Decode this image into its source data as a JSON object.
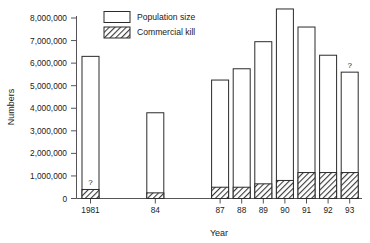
{
  "chart_data": {
    "type": "bar",
    "title": "",
    "xlabel": "Year",
    "ylabel": "Numbers",
    "categories": [
      "1981",
      "84",
      "87",
      "88",
      "89",
      "90",
      "91",
      "92",
      "93"
    ],
    "ylim": [
      0,
      8000000
    ],
    "ytick_values": [
      0,
      1000000,
      2000000,
      3000000,
      4000000,
      5000000,
      6000000,
      7000000,
      8000000
    ],
    "ytick_labels": [
      "0",
      "1,000,000",
      "2,000,000",
      "3,000,000",
      "4,000,000",
      "5,000,000",
      "6,000,000",
      "7,000,000",
      "8,000,000"
    ],
    "grid": false,
    "legend_position": "top-center",
    "stacked": true,
    "series": [
      {
        "name": "Population size",
        "style": "open-white",
        "values": [
          6300000,
          3800000,
          5250000,
          5750000,
          6950000,
          8400000,
          7600000,
          6350000,
          5600000
        ]
      },
      {
        "name": "Commercial kill",
        "style": "hatched",
        "values": [
          400000,
          250000,
          500000,
          500000,
          650000,
          800000,
          1150000,
          1150000,
          1150000
        ]
      }
    ],
    "annotations": [
      {
        "label": "?",
        "category": "1981",
        "placement": "inside-bar"
      },
      {
        "label": "?",
        "category": "93",
        "placement": "above-bar"
      }
    ]
  },
  "legend": {
    "items": [
      {
        "label": "Population size",
        "swatch": "open-white"
      },
      {
        "label": "Commercial kill",
        "swatch": "hatched"
      }
    ]
  },
  "colors": {
    "axis": "#555555",
    "bar_outline": "#2b2b2b",
    "bar_fill_population": "#ffffff",
    "bar_fill_kill": "#8a8a8a",
    "text": "#1a1a1a",
    "background": "#ffffff"
  }
}
